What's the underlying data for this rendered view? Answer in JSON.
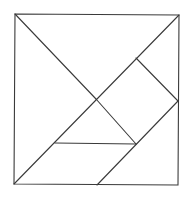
{
  "diagram": {
    "type": "tangram",
    "canvas": {
      "width": 189,
      "height": 197,
      "background": "#ffffff"
    },
    "stroke_color": "#3a3a3a",
    "square": {
      "tl": [
        15,
        14
      ],
      "tr": [
        179,
        15
      ],
      "br": [
        178,
        185
      ],
      "bl": [
        14,
        184
      ]
    },
    "lines": [
      {
        "name": "main-diagonal-tl-center",
        "x1": 15,
        "y1": 14,
        "x2": 96,
        "y2": 99
      },
      {
        "name": "center-to-bottom-mid",
        "x1": 96,
        "y1": 99,
        "x2": 136,
        "y2": 144
      },
      {
        "name": "anti-diagonal",
        "x1": 179,
        "y1": 15,
        "x2": 14,
        "y2": 184
      },
      {
        "name": "square-piece-top-edge",
        "x1": 136,
        "y1": 58,
        "x2": 178,
        "y2": 101
      },
      {
        "name": "parallelogram-right-edge",
        "x1": 178,
        "y1": 101,
        "x2": 97,
        "y2": 185
      },
      {
        "name": "small-triangle-base",
        "x1": 55,
        "y1": 143,
        "x2": 136,
        "y2": 144
      }
    ]
  }
}
